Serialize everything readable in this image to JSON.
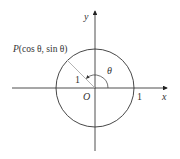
{
  "diagram": {
    "type": "unit-circle",
    "colors": {
      "background": "#ffffff",
      "axis": "#222222",
      "circle": "#333333",
      "radius": "#aaaaaa",
      "text": "#333333"
    },
    "axes": {
      "x_label": "x",
      "y_label": "y"
    },
    "origin_label": "O",
    "radius_label": "1",
    "x_intercept_label": "1",
    "angle_label": "θ",
    "point": {
      "name": "P",
      "coords_label": "(cos θ, sin θ)"
    }
  }
}
